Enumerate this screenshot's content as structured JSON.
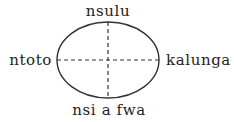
{
  "diagram": {
    "labels": {
      "top": "nsulu",
      "left": "ntoto",
      "right": "kalunga",
      "bottom": "nsi a fwa"
    },
    "colors": {
      "stroke": "#333333",
      "text": "#222222",
      "background": "#ffffff"
    }
  }
}
